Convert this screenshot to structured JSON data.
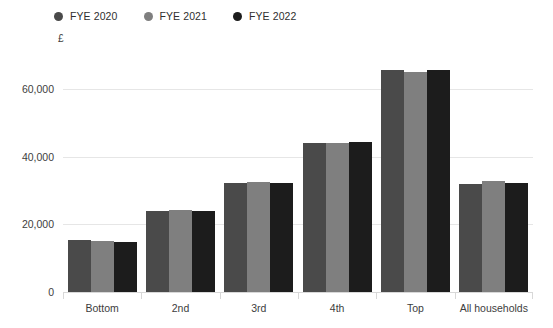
{
  "legend": {
    "items": [
      {
        "label": "FYE 2020",
        "color": "#4a4a4a",
        "icon": "circle-marker-icon"
      },
      {
        "label": "FYE 2021",
        "color": "#7f7f7f",
        "icon": "circle-marker-icon"
      },
      {
        "label": "FYE 2022",
        "color": "#1c1c1c",
        "icon": "circle-marker-icon"
      }
    ]
  },
  "axes": {
    "y_unit_label": "£",
    "y_ticks": [
      "0",
      "20,000",
      "40,000",
      "60,000"
    ],
    "y_tick_values": [
      0,
      20000,
      40000,
      60000
    ],
    "x_categories": [
      "Bottom",
      "2nd",
      "3rd",
      "4th",
      "Top",
      "All households"
    ]
  },
  "chart_data": {
    "type": "bar",
    "title": "",
    "subtitle": "",
    "xlabel": "",
    "ylabel": "£",
    "categories": [
      "Bottom",
      "2nd",
      "3rd",
      "4th",
      "Top",
      "All households"
    ],
    "series": [
      {
        "name": "FYE 2020",
        "color": "#4a4a4a",
        "values": [
          15300,
          23800,
          32300,
          43900,
          65700,
          32000
        ]
      },
      {
        "name": "FYE 2021",
        "color": "#7f7f7f",
        "values": [
          15200,
          24100,
          32600,
          43900,
          64900,
          32800
        ]
      },
      {
        "name": "FYE 2022",
        "color": "#1c1c1c",
        "values": [
          14800,
          23800,
          32300,
          44200,
          65700,
          32300
        ]
      }
    ],
    "ylim": [
      0,
      70000
    ],
    "yticks": [
      0,
      20000,
      40000,
      60000
    ],
    "grid": true,
    "legend_position": "top-left",
    "annotations": []
  },
  "colors": {
    "gridline": "#e6e6e6",
    "axisline": "#d8d8d8",
    "text": "#3d3d3d",
    "background": "#ffffff"
  }
}
